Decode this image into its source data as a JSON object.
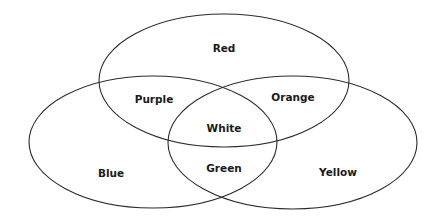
{
  "diagram": {
    "type": "venn",
    "sets": [
      {
        "id": "red",
        "label": "Red"
      },
      {
        "id": "blue",
        "label": "Blue"
      },
      {
        "id": "yellow",
        "label": "Yellow"
      }
    ],
    "regions": {
      "red": "Red",
      "blue": "Blue",
      "yellow": "Yellow",
      "red_blue": "Purple",
      "red_yellow": "Orange",
      "blue_yellow": "Green",
      "red_blue_yellow": "White"
    },
    "stroke_color": "#2a2a2a",
    "background": "#ffffff"
  }
}
